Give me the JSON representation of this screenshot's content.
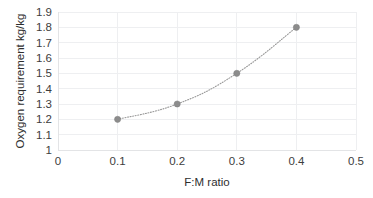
{
  "chart_data": {
    "type": "line",
    "title": "",
    "subtitle": "",
    "xlabel": "F:M ratio",
    "ylabel": "Oxygen requirement kg/kg",
    "x": [
      0.1,
      0.2,
      0.3,
      0.4
    ],
    "values": [
      1.2,
      1.3,
      1.5,
      1.8
    ],
    "series": [
      {
        "name": "Oxygen requirement",
        "x": [
          0.1,
          0.2,
          0.3,
          0.4
        ],
        "values": [
          1.2,
          1.3,
          1.5,
          1.8
        ]
      }
    ],
    "xlim": [
      0,
      0.5
    ],
    "ylim": [
      1,
      1.9
    ],
    "xticks": [
      0,
      0.1,
      0.2,
      0.3,
      0.4,
      0.5
    ],
    "yticks": [
      1,
      1.1,
      1.2,
      1.3,
      1.4,
      1.5,
      1.6,
      1.7,
      1.8,
      1.9
    ],
    "xtick_labels": [
      "0",
      "0.1",
      "0.2",
      "0.3",
      "0.4",
      "0.5"
    ],
    "ytick_labels": [
      "1",
      "1.1",
      "1.2",
      "1.3",
      "1.4",
      "1.5",
      "1.6",
      "1.7",
      "1.8",
      "1.9"
    ],
    "grid": {
      "horizontal": true,
      "vertical": true
    },
    "legend": {
      "visible": false,
      "position": "none",
      "entries": []
    },
    "annotations": [],
    "marker": {
      "shape": "circle",
      "color": "#8c8c8c"
    },
    "line": {
      "style": "dotted",
      "color": "#9a9a9a",
      "smooth": true
    },
    "colors": {
      "marker": "#8c8c8c",
      "line": "#9a9a9a",
      "grid": "#eeeff1",
      "axis": "#e3e4e6",
      "text": "#3d3d3d",
      "background": "#ffffff"
    }
  }
}
